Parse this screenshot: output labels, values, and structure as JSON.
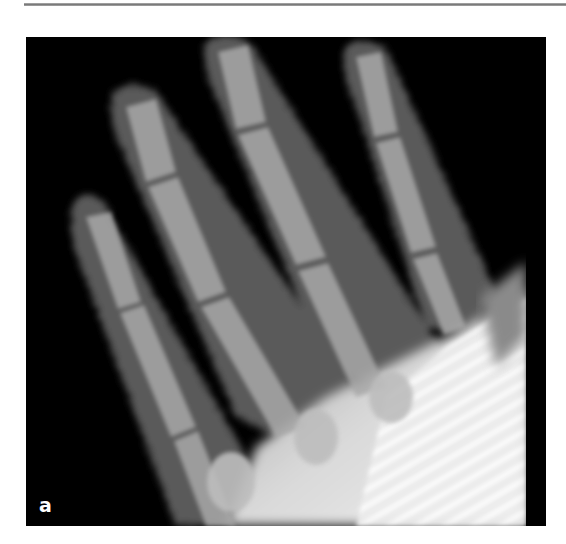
{
  "figure": {
    "panel_label": "a",
    "background_color": "#000000",
    "rule_color": "#888888"
  }
}
